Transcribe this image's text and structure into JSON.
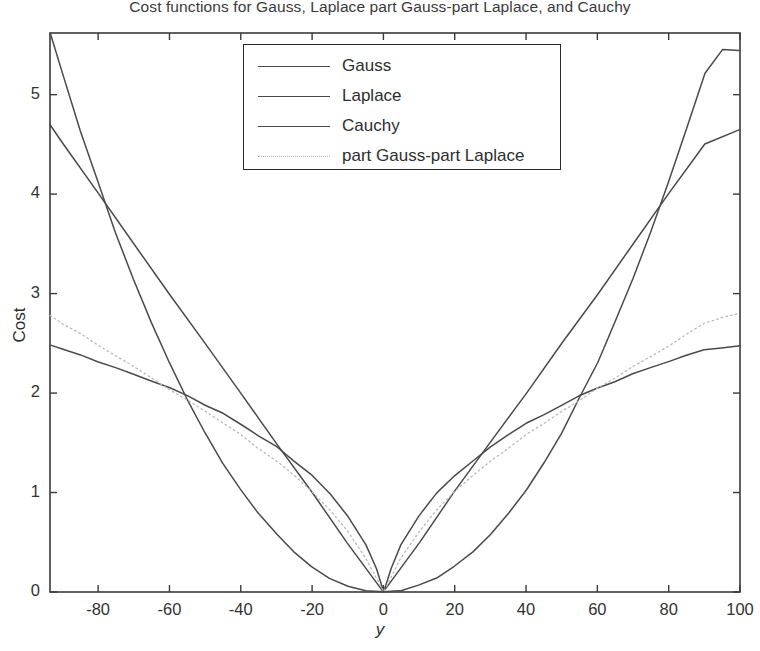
{
  "chart_data": {
    "type": "line",
    "title": "Cost functions for Gauss, Laplace part Gauss-part Laplace, and Cauchy",
    "xlabel": "y",
    "ylabel": "Cost",
    "xlim": [
      -93.5,
      100
    ],
    "ylim": [
      0,
      5.62
    ],
    "xticks": [
      -80,
      -60,
      -40,
      -20,
      0,
      20,
      40,
      60,
      80,
      100
    ],
    "xticklabels": [
      "-80",
      "-60",
      "-40",
      "-20",
      "0",
      "20",
      "40",
      "60",
      "80",
      "100"
    ],
    "yticks": [
      0,
      1,
      2,
      3,
      4,
      5
    ],
    "yticklabels": [
      "0",
      "1",
      "2",
      "3",
      "4",
      "5"
    ],
    "grid": false,
    "legend_position": "upper center",
    "line_color": "#4a4a4a",
    "dotted_color": "#b9b9b9",
    "axis_color": "#3a3a3a",
    "background": "#ffffff",
    "series": [
      {
        "name": "Gauss",
        "style": "solid",
        "x": [
          -93.5,
          -90,
          -85,
          -80,
          -75,
          -70,
          -65,
          -60,
          -55,
          -50,
          -45,
          -40,
          -35,
          -30,
          -25,
          -20,
          -15,
          -10,
          -5,
          0,
          5,
          10,
          15,
          20,
          25,
          30,
          35,
          40,
          45,
          50,
          55,
          60,
          65,
          70,
          75,
          80,
          85,
          90,
          95,
          100
        ],
        "y": [
          5.62,
          5.21,
          4.64,
          4.11,
          3.61,
          3.15,
          2.71,
          2.31,
          1.94,
          1.6,
          1.3,
          1.03,
          0.79,
          0.58,
          0.4,
          0.26,
          0.14,
          0.064,
          0.016,
          0.0,
          0.016,
          0.064,
          0.14,
          0.26,
          0.4,
          0.58,
          0.79,
          1.03,
          1.3,
          1.6,
          1.94,
          2.31,
          2.71,
          3.15,
          3.61,
          4.11,
          4.64,
          5.21,
          5.45,
          5.45
        ]
      },
      {
        "name": "Laplace",
        "style": "solid",
        "x": [
          -93.5,
          -90,
          -80,
          -70,
          -60,
          -50,
          -40,
          -30,
          -20,
          -10,
          0,
          10,
          20,
          30,
          40,
          50,
          60,
          70,
          80,
          90,
          100
        ],
        "y": [
          4.7,
          4.51,
          4.01,
          3.51,
          3.0,
          2.5,
          2.0,
          1.5,
          1.0,
          0.5,
          0.0,
          0.5,
          1.0,
          1.5,
          2.0,
          2.5,
          3.0,
          3.51,
          4.01,
          4.51,
          4.65
        ]
      },
      {
        "name": "Cauchy",
        "style": "solid",
        "x": [
          -93.5,
          -90,
          -85,
          -80,
          -75,
          -70,
          -65,
          -60,
          -55,
          -50,
          -45,
          -40,
          -35,
          -30,
          -25,
          -20,
          -15,
          -10,
          -5,
          -2,
          0,
          2,
          5,
          10,
          15,
          20,
          25,
          30,
          35,
          40,
          45,
          50,
          55,
          60,
          65,
          70,
          75,
          80,
          85,
          90,
          95,
          100
        ],
        "y": [
          2.48,
          2.44,
          2.38,
          2.32,
          2.26,
          2.19,
          2.12,
          2.05,
          1.97,
          1.88,
          1.79,
          1.69,
          1.58,
          1.46,
          1.32,
          1.17,
          0.99,
          0.77,
          0.47,
          0.23,
          0.0,
          0.23,
          0.47,
          0.77,
          0.99,
          1.17,
          1.32,
          1.46,
          1.58,
          1.69,
          1.79,
          1.88,
          1.97,
          2.05,
          2.12,
          2.19,
          2.26,
          2.32,
          2.38,
          2.44,
          2.46,
          2.47
        ]
      },
      {
        "name": "part Gauss-part Laplace",
        "style": "dotted",
        "x": [
          -93.5,
          -90,
          -85,
          -80,
          -75,
          -70,
          -65,
          -60,
          -55,
          -50,
          -45,
          -40,
          -35,
          -30,
          -25,
          -20,
          -15,
          -10,
          -5,
          0,
          5,
          10,
          15,
          20,
          25,
          30,
          35,
          40,
          45,
          50,
          55,
          60,
          65,
          70,
          75,
          80,
          85,
          90,
          95,
          100
        ],
        "y": [
          2.78,
          2.7,
          2.59,
          2.48,
          2.37,
          2.26,
          2.15,
          2.04,
          1.93,
          1.82,
          1.7,
          1.58,
          1.45,
          1.32,
          1.17,
          1.01,
          0.83,
          0.61,
          0.34,
          0.0,
          0.34,
          0.61,
          0.83,
          1.01,
          1.17,
          1.32,
          1.45,
          1.58,
          1.7,
          1.82,
          1.93,
          2.04,
          2.15,
          2.26,
          2.37,
          2.48,
          2.59,
          2.7,
          2.76,
          2.8
        ]
      }
    ]
  },
  "legend": {
    "entries": [
      {
        "label": "Gauss",
        "style": "solid"
      },
      {
        "label": "Laplace",
        "style": "solid"
      },
      {
        "label": "Cauchy",
        "style": "solid"
      },
      {
        "label": "part Gauss-part Laplace",
        "style": "dotted"
      }
    ]
  },
  "plot_box": {
    "left": 50,
    "top": 33,
    "right": 740,
    "bottom": 592
  }
}
